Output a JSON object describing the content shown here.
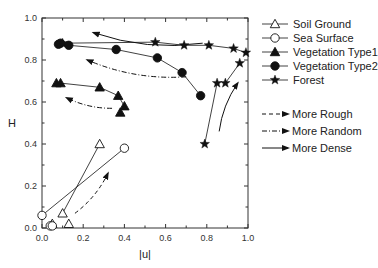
{
  "chart_data": {
    "type": "scatter",
    "title": "",
    "xlabel": "|u|",
    "ylabel": "H",
    "xlim": [
      0.0,
      1.0
    ],
    "ylim": [
      0.0,
      1.0
    ],
    "xticks": [
      "0.0",
      "0.2",
      "0.4",
      "0.6",
      "0.8",
      "1.0"
    ],
    "yticks": [
      "0.0",
      "0.2",
      "0.4",
      "0.6",
      "0.8",
      "1.0"
    ],
    "grid": false,
    "legend_position": "right",
    "series": [
      {
        "name": "Soil Ground",
        "marker": "triangle-open",
        "points": [
          [
            0.1,
            0.07
          ],
          [
            0.28,
            0.4
          ],
          [
            0.05,
            0.02
          ],
          [
            0.13,
            0.02
          ]
        ],
        "lines": [
          [
            [
              0.1,
              0.07
            ],
            [
              0.28,
              0.4
            ]
          ]
        ]
      },
      {
        "name": "Sea Surface",
        "marker": "circle-open",
        "points": [
          [
            0.0,
            0.06
          ],
          [
            0.4,
            0.38
          ],
          [
            0.04,
            0.01
          ],
          [
            0.05,
            0.01
          ]
        ],
        "lines": [
          [
            [
              0.0,
              0.06
            ],
            [
              0.4,
              0.38
            ]
          ]
        ]
      },
      {
        "name": "Vegetation Type1",
        "marker": "triangle-filled",
        "points": [
          [
            0.07,
            0.69
          ],
          [
            0.09,
            0.69
          ],
          [
            0.28,
            0.67
          ],
          [
            0.37,
            0.63
          ],
          [
            0.4,
            0.58
          ],
          [
            0.38,
            0.55
          ]
        ],
        "lines": [
          [
            [
              0.07,
              0.69
            ],
            [
              0.09,
              0.69
            ],
            [
              0.28,
              0.67
            ],
            [
              0.37,
              0.63
            ],
            [
              0.4,
              0.58
            ]
          ]
        ]
      },
      {
        "name": "Vegetation Type2",
        "marker": "circle-filled",
        "points": [
          [
            0.08,
            0.875
          ],
          [
            0.09,
            0.88
          ],
          [
            0.13,
            0.87
          ],
          [
            0.36,
            0.85
          ],
          [
            0.56,
            0.81
          ],
          [
            0.68,
            0.74
          ],
          [
            0.77,
            0.63
          ]
        ],
        "lines": [
          [
            [
              0.08,
              0.875
            ],
            [
              0.13,
              0.87
            ],
            [
              0.36,
              0.85
            ],
            [
              0.56,
              0.81
            ],
            [
              0.68,
              0.74
            ],
            [
              0.77,
              0.63
            ]
          ]
        ]
      },
      {
        "name": "Forest",
        "marker": "star",
        "points": [
          [
            0.1,
            0.88
          ],
          [
            0.55,
            0.885
          ],
          [
            0.69,
            0.87
          ],
          [
            0.81,
            0.87
          ],
          [
            0.93,
            0.855
          ],
          [
            0.99,
            0.835
          ],
          [
            0.96,
            0.785
          ],
          [
            0.85,
            0.69
          ],
          [
            0.89,
            0.69
          ],
          [
            0.79,
            0.4
          ]
        ],
        "lines": [
          [
            [
              0.1,
              0.88
            ],
            [
              0.55,
              0.885
            ],
            [
              0.69,
              0.87
            ],
            [
              0.81,
              0.87
            ],
            [
              0.93,
              0.855
            ],
            [
              0.99,
              0.835
            ]
          ],
          [
            [
              0.96,
              0.785
            ],
            [
              0.89,
              0.69
            ]
          ],
          [
            [
              0.85,
              0.69
            ],
            [
              0.79,
              0.4
            ]
          ]
        ]
      }
    ],
    "annotations": {
      "arrows": [
        {
          "style": "dashed",
          "meaning": "More Rough",
          "from": [
            0.16,
            0.07
          ],
          "to": [
            0.32,
            0.26
          ]
        },
        {
          "style": "dash-dot",
          "meaning": "More Random",
          "from": [
            0.7,
            0.72
          ],
          "to": [
            0.22,
            0.8
          ]
        },
        {
          "style": "dash-dot",
          "meaning": "More Random",
          "from": [
            0.34,
            0.57
          ],
          "to": [
            0.12,
            0.62
          ]
        },
        {
          "style": "solid",
          "meaning": "More Dense",
          "from": [
            0.78,
            0.88
          ],
          "to": [
            0.25,
            0.93
          ]
        },
        {
          "style": "solid",
          "meaning": "More Dense",
          "from": [
            0.86,
            0.46
          ],
          "to": [
            0.95,
            0.69
          ]
        }
      ],
      "legend_arrows": [
        "More Rough",
        "More Random",
        "More Dense"
      ]
    }
  },
  "legend": {
    "items": [
      {
        "label": "Soil Ground",
        "marker": "triangle-open"
      },
      {
        "label": "Sea Surface",
        "marker": "circle-open"
      },
      {
        "label": "Vegetation Type1",
        "marker": "triangle-filled"
      },
      {
        "label": "Vegetation Type2",
        "marker": "circle-filled"
      },
      {
        "label": "Forest",
        "marker": "star"
      }
    ],
    "arrows": [
      {
        "label": "More Rough",
        "style": "dashed"
      },
      {
        "label": "More Random",
        "style": "dash-dot"
      },
      {
        "label": "More Dense",
        "style": "solid"
      }
    ]
  },
  "colors": {
    "ink": "#111111",
    "axis": "#333333",
    "background": "#ffffff"
  }
}
